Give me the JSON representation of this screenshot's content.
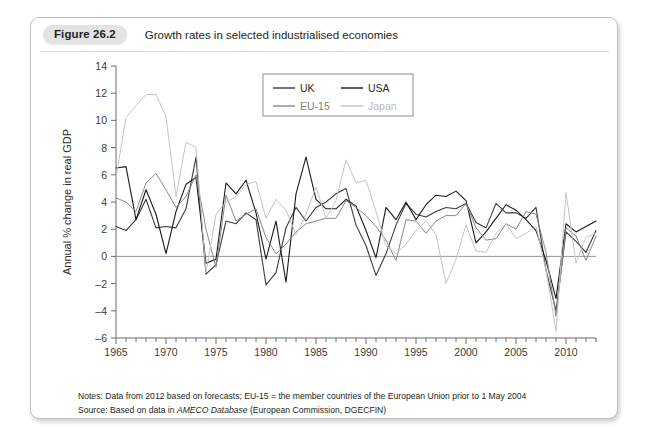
{
  "figure": {
    "badge": "Figure 26.2",
    "title": "Growth rates in selected industrialised economies"
  },
  "notes": {
    "line1_prefix": "Notes: Data from 2012 based on forecasts; EU-15 = the member countries of the European Union prior to 1 May 2004",
    "line2_prefix": "Source: Based on data in ",
    "line2_italic": "AMECO Database",
    "line2_suffix": " (European Commission, DGECFIN)"
  },
  "colors": {
    "uk": "#3a3a3a",
    "usa": "#1a1a1a",
    "eu15": "#8a8a8a",
    "japan": "#c4c4c4",
    "axis": "#6b6b6b",
    "zero_line": "#9a9a9a",
    "legend_border": "#8d8d8d",
    "card_border": "#bfbfbf",
    "badge_bg": "#e3e3e3"
  },
  "chart_data": {
    "type": "line",
    "title": "Growth rates in selected industrialised economies",
    "xlabel": "",
    "ylabel": "Annual % change in real GDP",
    "xlim": [
      1965,
      2013
    ],
    "ylim": [
      -6,
      14
    ],
    "ytick_step": 2,
    "yticks": [
      -6,
      -4,
      -2,
      0,
      2,
      4,
      6,
      8,
      10,
      12,
      14
    ],
    "xticks_labeled": [
      1965,
      1970,
      1975,
      1980,
      1985,
      1990,
      1995,
      2000,
      2005,
      2010
    ],
    "xtick_minor_step": 1,
    "grid": false,
    "zero_line": true,
    "legend_position": "top-center",
    "x": [
      1965,
      1966,
      1967,
      1968,
      1969,
      1970,
      1971,
      1972,
      1973,
      1974,
      1975,
      1976,
      1977,
      1978,
      1979,
      1980,
      1981,
      1982,
      1983,
      1984,
      1985,
      1986,
      1987,
      1988,
      1989,
      1990,
      1991,
      1992,
      1993,
      1994,
      1995,
      1996,
      1997,
      1998,
      1999,
      2000,
      2001,
      2002,
      2003,
      2004,
      2005,
      2006,
      2007,
      2008,
      2009,
      2010,
      2011,
      2012,
      2013
    ],
    "series": [
      {
        "name": "UK",
        "color": "#3a3a3a",
        "values": [
          2.2,
          1.9,
          2.7,
          4.2,
          2.1,
          2.2,
          2.1,
          3.5,
          7.3,
          -1.3,
          -0.6,
          2.6,
          2.4,
          3.2,
          2.7,
          -2.1,
          -1.2,
          2.1,
          3.6,
          2.6,
          3.6,
          4.0,
          4.6,
          5.0,
          2.3,
          0.8,
          -1.4,
          0.2,
          2.3,
          3.9,
          3.1,
          2.9,
          3.3,
          3.6,
          3.5,
          3.9,
          2.5,
          2.1,
          3.9,
          3.2,
          3.2,
          2.8,
          3.6,
          -1.0,
          -4.0,
          1.8,
          1.1,
          0.3,
          1.9
        ]
      },
      {
        "name": "USA",
        "color": "#1a1a1a",
        "values": [
          6.5,
          6.6,
          2.7,
          4.9,
          3.1,
          0.2,
          3.3,
          5.3,
          5.8,
          -0.5,
          -0.2,
          5.4,
          4.6,
          5.6,
          3.2,
          -0.2,
          2.6,
          -1.9,
          4.6,
          7.3,
          4.2,
          3.5,
          3.5,
          4.2,
          3.7,
          1.9,
          -0.1,
          3.6,
          2.7,
          4.0,
          2.7,
          3.8,
          4.5,
          4.4,
          4.8,
          4.1,
          1.0,
          1.8,
          2.8,
          3.8,
          3.4,
          2.7,
          1.9,
          -0.3,
          -3.1,
          2.4,
          1.8,
          2.2,
          2.6
        ]
      },
      {
        "name": "EU-15",
        "color": "#8a8a8a",
        "values": [
          4.3,
          4.0,
          3.3,
          5.4,
          6.1,
          4.9,
          3.6,
          4.4,
          6.0,
          2.0,
          -0.8,
          4.5,
          2.6,
          3.1,
          3.5,
          1.4,
          0.2,
          0.9,
          1.8,
          2.4,
          2.6,
          2.8,
          2.8,
          4.1,
          3.6,
          3.0,
          2.2,
          1.2,
          -0.3,
          2.7,
          2.6,
          1.7,
          2.6,
          3.0,
          3.0,
          3.9,
          2.1,
          1.2,
          1.3,
          2.4,
          2.0,
          3.3,
          3.1,
          0.3,
          -4.4,
          2.1,
          1.5,
          -0.3,
          1.5
        ]
      },
      {
        "name": "Japan",
        "color": "#c4c4c4",
        "values": [
          5.8,
          10.2,
          11.1,
          11.9,
          11.9,
          10.3,
          4.4,
          8.4,
          8.0,
          -1.2,
          3.1,
          4.0,
          4.4,
          5.3,
          5.5,
          2.8,
          4.2,
          3.4,
          1.6,
          3.1,
          5.1,
          2.8,
          4.1,
          7.1,
          5.4,
          5.6,
          3.3,
          0.8,
          0.2,
          0.9,
          1.9,
          2.6,
          1.6,
          -2.0,
          -0.2,
          2.3,
          0.4,
          0.3,
          1.7,
          2.4,
          1.3,
          1.7,
          2.2,
          -1.0,
          -5.5,
          4.7,
          -0.5,
          1.4,
          1.7
        ]
      }
    ],
    "legend": [
      {
        "label": "UK",
        "color": "#3a3a3a"
      },
      {
        "label": "USA",
        "color": "#1a1a1a"
      },
      {
        "label": "EU-15",
        "color": "#8a8a8a"
      },
      {
        "label": "Japan",
        "color": "#c4c4c4"
      }
    ]
  }
}
